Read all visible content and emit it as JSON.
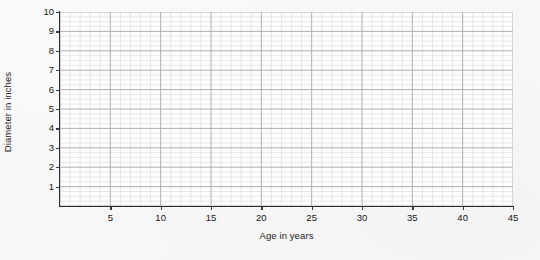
{
  "chart_data": {
    "type": "line",
    "title": "",
    "subtitle": "",
    "xlabel": "Age in years",
    "ylabel": "Diameter in inches",
    "xlim": [
      0,
      45
    ],
    "ylim": [
      0,
      10
    ],
    "x_major_tick_labels": [
      "5",
      "10",
      "15",
      "20",
      "25",
      "30",
      "35",
      "40",
      "45"
    ],
    "x_major_tick_values": [
      5,
      10,
      15,
      20,
      25,
      30,
      35,
      40,
      45
    ],
    "x_major_step": 5,
    "x_minor_step": 1,
    "y_major_tick_labels": [
      "1",
      "2",
      "3",
      "4",
      "5",
      "6",
      "7",
      "8",
      "9",
      "10"
    ],
    "y_major_tick_values": [
      1,
      2,
      3,
      4,
      5,
      6,
      7,
      8,
      9,
      10
    ],
    "y_major_step": 1,
    "y_minor_step": 0.25,
    "grid": true,
    "grid_major_color": "#b0b0b0",
    "grid_minor_color": "#dcdcdc",
    "legend": null,
    "legend_position": "none",
    "series": [],
    "values": [],
    "annotations": [],
    "note": "Empty grid / graph paper worksheet: no data plotted"
  },
  "figure": {
    "background_color": "#f7f7f7",
    "plot_background_color": "#fdfdfd",
    "axis_color": "#2c2c2c"
  }
}
